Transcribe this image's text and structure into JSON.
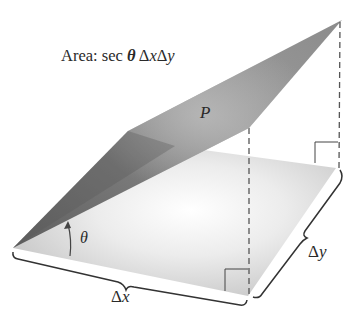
{
  "diagram": {
    "title": {
      "prefix": "Area: sec ",
      "theta": "θ",
      "delta_x": " Δ",
      "x": "x",
      "delta_y": "Δ",
      "y": "y"
    },
    "labels": {
      "plane_point": "P",
      "angle": "θ",
      "dx_delta": "Δ",
      "dx_var": "x",
      "dy_delta": "Δ",
      "dy_var": "y"
    },
    "colors": {
      "base_light": "#e8e8e8",
      "base_mid": "#cfcfcf",
      "plane_dark": "#6e6e6e",
      "plane_mid": "#8a8a8a",
      "plane_light": "#a6a6a6",
      "line": "#333333",
      "dash": "#555555"
    },
    "shapes": {
      "base_region": "parallelogram ΔxΔy in xy-plane",
      "tilted_plane": "tangent plane region above base",
      "right_angle_markers": 2,
      "dashed_verticals": 2,
      "braces": [
        "Δx",
        "Δy"
      ]
    }
  }
}
